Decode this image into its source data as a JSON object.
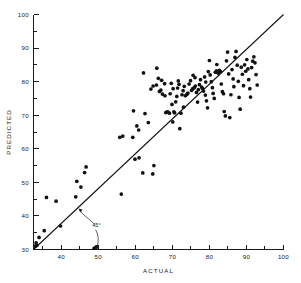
{
  "chart_data": {
    "type": "scatter",
    "title": "",
    "xlabel": "ACTUAL",
    "ylabel": "PREDICTED",
    "xlim": [
      32.5,
      100
    ],
    "ylim": [
      30,
      100
    ],
    "grid": false,
    "legend": null,
    "x_major_ticks": [
      40,
      50,
      60,
      70,
      80,
      90,
      100
    ],
    "x_major_tick_labels": [
      "40",
      "50",
      "60",
      "70",
      "80",
      "90",
      "100"
    ],
    "x_minor_ticks": [
      35,
      45,
      55,
      65,
      75,
      85,
      95
    ],
    "y_major_ticks": [
      30,
      40,
      50,
      60,
      70,
      80,
      90,
      100
    ],
    "y_major_tick_labels": [
      "30",
      "40",
      "50",
      "60",
      "70",
      "80",
      "90",
      "100"
    ],
    "y_minor_ticks": [
      35,
      45,
      55,
      65,
      75,
      85,
      95
    ],
    "annotations": [
      {
        "label": "45°",
        "description": "forty-five-degree reference line angle callout",
        "x": 49.5,
        "y": 36.8
      }
    ],
    "reference_line": {
      "name": "45-degree identity line",
      "from": [
        32.5,
        30.0
      ],
      "to": [
        100.0,
        100.0
      ],
      "slope": 1,
      "style": "solid"
    },
    "marker": {
      "shape": "filled-circle",
      "color": "#111111",
      "size": 1.85
    },
    "point_count": 134,
    "points": [
      [
        33.0,
        31.0
      ],
      [
        33.4,
        31.2
      ],
      [
        33.2,
        32.0
      ],
      [
        34.0,
        33.6
      ],
      [
        36.0,
        45.5
      ],
      [
        35.4,
        35.6
      ],
      [
        38.6,
        44.4
      ],
      [
        39.8,
        37.0
      ],
      [
        43.9,
        45.7
      ],
      [
        44.2,
        50.3
      ],
      [
        45.3,
        48.6
      ],
      [
        46.3,
        52.9
      ],
      [
        46.7,
        54.6
      ],
      [
        56.2,
        46.5
      ],
      [
        55.8,
        63.4
      ],
      [
        56.6,
        63.8
      ],
      [
        59.3,
        63.4
      ],
      [
        59.5,
        71.3
      ],
      [
        60.4,
        66.8
      ],
      [
        60.9,
        65.6
      ],
      [
        61.0,
        57.3
      ],
      [
        62.2,
        82.6
      ],
      [
        62.0,
        52.8
      ],
      [
        63.5,
        67.8
      ],
      [
        64.7,
        52.5
      ],
      [
        65.0,
        55.0
      ],
      [
        65.8,
        84.0
      ],
      [
        64.8,
        78.7
      ],
      [
        65.7,
        79.0
      ],
      [
        66.5,
        77.1
      ],
      [
        66.9,
        77.5
      ],
      [
        67.1,
        80.4
      ],
      [
        67.3,
        76.3
      ],
      [
        67.9,
        79.4
      ],
      [
        68.0,
        75.8
      ],
      [
        68.2,
        70.8
      ],
      [
        68.6,
        71.0
      ],
      [
        68.8,
        70.9
      ],
      [
        69.2,
        70.6
      ],
      [
        69.4,
        76.4
      ],
      [
        69.7,
        79.5
      ],
      [
        69.9,
        73.2
      ],
      [
        70.1,
        68.0
      ],
      [
        70.4,
        71.0
      ],
      [
        70.6,
        70.7
      ],
      [
        70.9,
        74.0
      ],
      [
        71.2,
        75.6
      ],
      [
        71.4,
        78.1
      ],
      [
        71.6,
        80.2
      ],
      [
        71.8,
        79.2
      ],
      [
        72.0,
        66.0
      ],
      [
        72.3,
        70.6
      ],
      [
        72.6,
        76.1
      ],
      [
        72.9,
        77.3
      ],
      [
        73.2,
        78.6
      ],
      [
        73.5,
        75.8
      ],
      [
        73.9,
        76.2
      ],
      [
        74.2,
        76.6
      ],
      [
        74.5,
        79.3
      ],
      [
        74.9,
        80.3
      ],
      [
        75.2,
        77.4
      ],
      [
        75.5,
        77.9
      ],
      [
        75.9,
        78.2
      ],
      [
        76.2,
        78.7
      ],
      [
        76.5,
        76.8
      ],
      [
        76.8,
        73.9
      ],
      [
        77.0,
        77.6
      ],
      [
        77.3,
        79.1
      ],
      [
        77.6,
        80.6
      ],
      [
        77.9,
        78.4
      ],
      [
        78.1,
        78.0
      ],
      [
        78.4,
        77.2
      ],
      [
        78.7,
        81.4
      ],
      [
        79.0,
        79.9
      ],
      [
        79.2,
        74.3
      ],
      [
        79.5,
        72.2
      ],
      [
        79.7,
        83.0
      ],
      [
        80.0,
        86.3
      ],
      [
        80.2,
        82.0
      ],
      [
        80.5,
        80.0
      ],
      [
        80.8,
        78.2
      ],
      [
        81.0,
        76.5
      ],
      [
        81.3,
        75.0
      ],
      [
        81.6,
        82.8
      ],
      [
        81.9,
        83.2
      ],
      [
        82.2,
        82.9
      ],
      [
        82.4,
        82.5
      ],
      [
        82.7,
        83.4
      ],
      [
        83.0,
        83.0
      ],
      [
        83.2,
        79.3
      ],
      [
        83.5,
        77.0
      ],
      [
        83.8,
        76.4
      ],
      [
        84.0,
        71.1
      ],
      [
        84.3,
        69.8
      ],
      [
        84.6,
        86.2
      ],
      [
        84.9,
        88.8
      ],
      [
        85.2,
        82.3
      ],
      [
        85.5,
        69.3
      ],
      [
        85.8,
        76.1
      ],
      [
        86.1,
        83.6
      ],
      [
        86.4,
        80.8
      ],
      [
        86.6,
        78.5
      ],
      [
        86.9,
        87.2
      ],
      [
        87.2,
        89.0
      ],
      [
        87.5,
        84.9
      ],
      [
        87.8,
        80.1
      ],
      [
        88.0,
        75.3
      ],
      [
        88.3,
        71.8
      ],
      [
        88.6,
        84.3
      ],
      [
        88.9,
        82.2
      ],
      [
        89.2,
        78.8
      ],
      [
        89.5,
        85.0
      ],
      [
        89.8,
        83.1
      ],
      [
        90.1,
        86.6
      ],
      [
        90.4,
        83.8
      ],
      [
        90.6,
        80.6
      ],
      [
        90.9,
        77.9
      ],
      [
        91.1,
        75.4
      ],
      [
        91.4,
        84.2
      ],
      [
        91.7,
        86.1
      ],
      [
        92.0,
        87.4
      ],
      [
        92.3,
        85.6
      ],
      [
        92.6,
        82.1
      ],
      [
        92.9,
        79.0
      ],
      [
        75.6,
        81.9
      ],
      [
        76.1,
        81.2
      ],
      [
        78.9,
        76.0
      ],
      [
        82.0,
        85.1
      ],
      [
        70.2,
        77.9
      ],
      [
        73.0,
        72.4
      ],
      [
        66.2,
        81.0
      ],
      [
        64.2,
        77.8
      ],
      [
        62.6,
        70.5
      ],
      [
        59.9,
        56.9
      ],
      [
        48.9,
        30.4
      ],
      [
        49.4,
        30.6
      ]
    ]
  }
}
